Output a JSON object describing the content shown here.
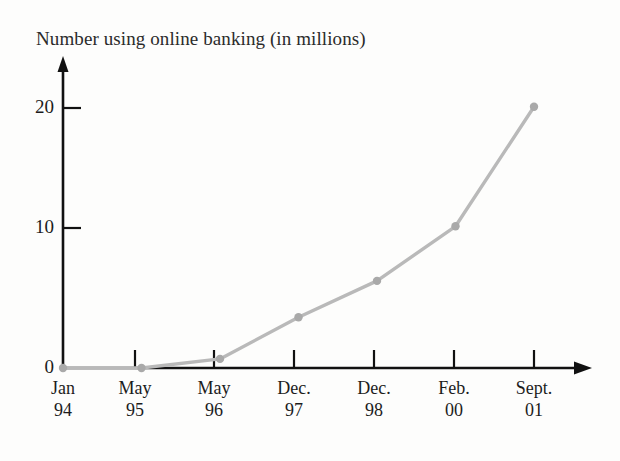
{
  "chart_data": {
    "type": "line",
    "title": "Number using online banking (in millions)",
    "xlabel": "",
    "ylabel": "",
    "categories": [
      "Jan 94",
      "May 95",
      "May 96",
      "Dec. 97",
      "Dec. 98",
      "Feb. 00",
      "Sept. 01"
    ],
    "category_months": [
      "Jan",
      "May",
      "May",
      "Dec.",
      "Dec.",
      "Feb.",
      "Sept."
    ],
    "category_years": [
      "94",
      "95",
      "96",
      "97",
      "98",
      "00",
      "01"
    ],
    "values": [
      0,
      0,
      0.7,
      3.9,
      6.7,
      10.9,
      20.1
    ],
    "ylim": [
      0,
      23
    ],
    "yticks": [
      0,
      10,
      20
    ],
    "ytick_labels": [
      "0",
      "10",
      "20"
    ],
    "grid": false,
    "legend": "none",
    "series": [
      {
        "name": "Number using online banking (in millions)",
        "values": [
          0,
          0,
          0.7,
          3.9,
          6.7,
          10.9,
          20.1
        ]
      }
    ],
    "colors": {
      "line": "#b9b9b9",
      "marker": "#a9a9a9",
      "axis": "#111111",
      "text": "#1c1c1c",
      "background": "#fdfdfc"
    }
  }
}
